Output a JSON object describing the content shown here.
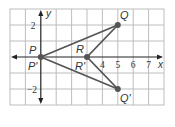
{
  "diagram": {
    "type": "coordinate-plane-reflection",
    "axes": {
      "x_label": "x",
      "y_label": "y",
      "x_ticks": [
        "4",
        "5",
        "6",
        "7"
      ],
      "y_ticks": [
        "2",
        "−2"
      ],
      "x_range": [
        -2,
        8
      ],
      "y_range": [
        -3,
        3
      ]
    },
    "points": [
      {
        "name": "P",
        "coord": [
          0,
          0
        ],
        "label": "P"
      },
      {
        "name": "P'",
        "coord": [
          0,
          0
        ],
        "label": "P'"
      },
      {
        "name": "Q",
        "coord": [
          5,
          2
        ],
        "label": "Q"
      },
      {
        "name": "Q'",
        "coord": [
          5,
          -2
        ],
        "label": "Q'"
      },
      {
        "name": "R",
        "coord": [
          3,
          0
        ],
        "label": "R"
      },
      {
        "name": "R'",
        "coord": [
          3,
          0
        ],
        "label": "R'"
      }
    ],
    "triangles": [
      {
        "name": "PQR",
        "vertices": [
          "P",
          "Q",
          "R"
        ]
      },
      {
        "name": "P'Q'R'",
        "vertices": [
          "P'",
          "Q'",
          "R'"
        ]
      }
    ],
    "colors": {
      "grid": "#bdbdbd",
      "axis": "#222222",
      "segment": "#555555",
      "point": "#555555"
    }
  }
}
